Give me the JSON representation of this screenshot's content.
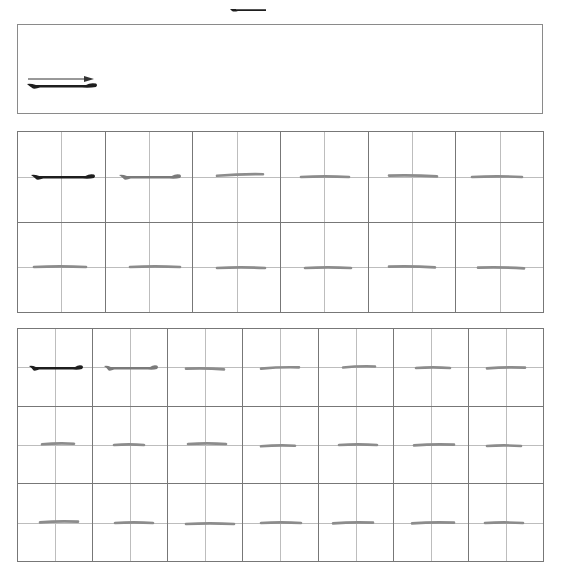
{
  "sheet": {
    "character": "一",
    "stroke_name": "horizontal stroke",
    "colors": {
      "ink_dark": "#1e1e1e",
      "ink_gray": "#7a7a7a",
      "trace": "#8c8c8c",
      "grid_outer": "#777777",
      "grid_guide": "#bdbdbd",
      "border": "#8a8a8a"
    }
  },
  "demo_box": {
    "direction_arrow_icon": "arrow-right-icon",
    "example_stroke": "dark"
  },
  "practice_grid_a": {
    "columns": 6,
    "rows": 2,
    "cells": [
      {
        "style": "dark",
        "x": 12,
        "w": 66,
        "dy": 0,
        "tilt": 0
      },
      {
        "style": "gray",
        "x": 12,
        "w": 64,
        "dy": 0,
        "tilt": 0
      },
      {
        "style": "trace",
        "x": 24,
        "w": 46,
        "dy": -2,
        "tilt": -2
      },
      {
        "style": "trace",
        "x": 20,
        "w": 48,
        "dy": 0,
        "tilt": 0
      },
      {
        "style": "trace",
        "x": 20,
        "w": 48,
        "dy": -1,
        "tilt": 1
      },
      {
        "style": "trace",
        "x": 16,
        "w": 50,
        "dy": 0,
        "tilt": 0
      },
      {
        "style": "trace",
        "x": 16,
        "w": 52,
        "dy": -1,
        "tilt": 0
      },
      {
        "style": "trace",
        "x": 24,
        "w": 50,
        "dy": -1,
        "tilt": 0
      },
      {
        "style": "trace",
        "x": 24,
        "w": 48,
        "dy": 0,
        "tilt": 0
      },
      {
        "style": "trace",
        "x": 24,
        "w": 46,
        "dy": 0,
        "tilt": 0
      },
      {
        "style": "trace",
        "x": 20,
        "w": 46,
        "dy": -1,
        "tilt": 1
      },
      {
        "style": "trace",
        "x": 22,
        "w": 46,
        "dy": 0,
        "tilt": 1
      }
    ]
  },
  "practice_grid_b": {
    "columns": 7,
    "rows": 3,
    "cells": [
      {
        "style": "dark",
        "x": 10,
        "w": 56,
        "dy": 0,
        "tilt": 0
      },
      {
        "style": "gray",
        "x": 10,
        "w": 56,
        "dy": 0,
        "tilt": 0
      },
      {
        "style": "trace",
        "x": 18,
        "w": 38,
        "dy": 1,
        "tilt": 1
      },
      {
        "style": "trace",
        "x": 18,
        "w": 38,
        "dy": 0,
        "tilt": -2
      },
      {
        "style": "trace",
        "x": 24,
        "w": 32,
        "dy": -1,
        "tilt": -2
      },
      {
        "style": "trace",
        "x": 22,
        "w": 34,
        "dy": 0,
        "tilt": 0
      },
      {
        "style": "trace",
        "x": 18,
        "w": 38,
        "dy": 0,
        "tilt": -1
      },
      {
        "style": "trace",
        "x": 24,
        "w": 32,
        "dy": -1,
        "tilt": -1
      },
      {
        "style": "trace",
        "x": 21,
        "w": 30,
        "dy": 0,
        "tilt": 0
      },
      {
        "style": "trace",
        "x": 20,
        "w": 38,
        "dy": -1,
        "tilt": 0
      },
      {
        "style": "trace",
        "x": 18,
        "w": 34,
        "dy": 1,
        "tilt": -1
      },
      {
        "style": "trace",
        "x": 20,
        "w": 38,
        "dy": 0,
        "tilt": 0
      },
      {
        "style": "trace",
        "x": 20,
        "w": 40,
        "dy": 0,
        "tilt": -1
      },
      {
        "style": "trace",
        "x": 18,
        "w": 34,
        "dy": 1,
        "tilt": 0
      },
      {
        "style": "trace",
        "x": 22,
        "w": 38,
        "dy": -1,
        "tilt": -1
      },
      {
        "style": "trace",
        "x": 22,
        "w": 38,
        "dy": 0,
        "tilt": 0
      },
      {
        "style": "trace",
        "x": 18,
        "w": 48,
        "dy": 1,
        "tilt": 0
      },
      {
        "style": "trace",
        "x": 18,
        "w": 40,
        "dy": 0,
        "tilt": 0
      },
      {
        "style": "trace",
        "x": 14,
        "w": 40,
        "dy": 0,
        "tilt": -1
      },
      {
        "style": "trace",
        "x": 18,
        "w": 42,
        "dy": 0,
        "tilt": -1
      },
      {
        "style": "trace",
        "x": 16,
        "w": 38,
        "dy": 0,
        "tilt": 0
      }
    ]
  }
}
